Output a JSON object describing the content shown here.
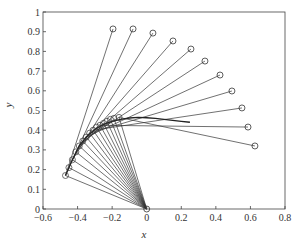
{
  "chart_data": {
    "type": "line",
    "title": "",
    "xlabel": "x",
    "ylabel": "y",
    "xlim": [
      -0.6,
      0.8
    ],
    "ylim": [
      0,
      1
    ],
    "xticks": [
      "-0.6",
      "-0.4",
      "-0.2",
      "0",
      "0.2",
      "0.4",
      "0.6",
      "0.8"
    ],
    "xtick_values": [
      -0.6,
      -0.4,
      -0.2,
      0,
      0.2,
      0.4,
      0.6,
      0.8
    ],
    "yticks": [
      "0",
      "0.1",
      "0.2",
      "0.3",
      "0.4",
      "0.5",
      "0.6",
      "0.7",
      "0.8",
      "0.9",
      "1"
    ],
    "ytick_values": [
      0,
      0.1,
      0.2,
      0.3,
      0.4,
      0.5,
      0.6,
      0.7,
      0.8,
      0.9,
      1.0
    ],
    "grid": false,
    "legend": null,
    "pivot": [
      0,
      0
    ],
    "inner_points": [
      [
        -0.47,
        0.17
      ],
      [
        -0.45,
        0.21
      ],
      [
        -0.43,
        0.25
      ],
      [
        -0.41,
        0.29
      ],
      [
        -0.39,
        0.32
      ],
      [
        -0.37,
        0.345
      ],
      [
        -0.35,
        0.365
      ],
      [
        -0.33,
        0.385
      ],
      [
        -0.31,
        0.4
      ],
      [
        -0.29,
        0.415
      ],
      [
        -0.27,
        0.425
      ],
      [
        -0.25,
        0.435
      ],
      [
        -0.23,
        0.445
      ],
      [
        -0.21,
        0.455
      ],
      [
        -0.19,
        0.46
      ],
      [
        -0.16,
        0.465
      ]
    ],
    "outer_points": [
      [
        -0.195,
        0.914
      ],
      [
        -0.079,
        0.914
      ],
      [
        0.036,
        0.893
      ],
      [
        0.152,
        0.853
      ],
      [
        0.256,
        0.812
      ],
      [
        0.337,
        0.751
      ],
      [
        0.424,
        0.68
      ],
      [
        0.493,
        0.599
      ],
      [
        0.551,
        0.513
      ],
      [
        0.586,
        0.416
      ],
      [
        0.626,
        0.32
      ]
    ],
    "outer_link_sources": [
      0,
      1,
      2,
      3,
      4,
      5,
      6,
      7,
      8,
      10,
      15
    ],
    "trace_curve": [
      [
        -0.47,
        0.17
      ],
      [
        -0.43,
        0.25
      ],
      [
        -0.39,
        0.32
      ],
      [
        -0.35,
        0.365
      ],
      [
        -0.3,
        0.405
      ],
      [
        -0.25,
        0.43
      ],
      [
        -0.2,
        0.445
      ],
      [
        -0.15,
        0.455
      ],
      [
        -0.1,
        0.462
      ],
      [
        -0.05,
        0.465
      ],
      [
        0.0,
        0.463
      ],
      [
        0.05,
        0.46
      ],
      [
        0.1,
        0.455
      ],
      [
        0.15,
        0.45
      ],
      [
        0.2,
        0.445
      ],
      [
        0.25,
        0.44
      ]
    ]
  }
}
